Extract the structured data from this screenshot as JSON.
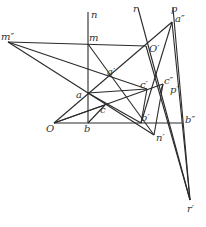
{
  "diagram": {
    "type": "geometric-construction",
    "line_color": "#2a2a2a",
    "label_color": "#333333",
    "points": {
      "m2": {
        "label": "m″",
        "x": 8,
        "y": 42,
        "lx": 1,
        "ly": 40
      },
      "m": {
        "label": "m",
        "x": 88,
        "y": 44,
        "lx": 89,
        "ly": 41
      },
      "n": {
        "label": "n",
        "x": 88,
        "y": 12,
        "lx": 91,
        "ly": 18
      },
      "r": {
        "label": "r",
        "x": 138,
        "y": 8,
        "lx": 133,
        "ly": 12
      },
      "p": {
        "label": "p",
        "x": 173,
        "y": 8,
        "lx": 171,
        "ly": 12
      },
      "a2": {
        "label": "a″",
        "x": 172,
        "y": 22,
        "lx": 175,
        "ly": 22
      },
      "O1": {
        "label": "O′",
        "x": 146,
        "y": 46,
        "lx": 149,
        "ly": 52
      },
      "a1": {
        "label": "a′",
        "x": 109,
        "y": 77,
        "lx": 107,
        "ly": 75
      },
      "a": {
        "label": "a",
        "x": 88,
        "y": 93,
        "lx": 76,
        "ly": 98
      },
      "c": {
        "label": "c",
        "x": 105,
        "y": 105,
        "lx": 100,
        "ly": 113
      },
      "c1": {
        "label": "c′",
        "x": 147,
        "y": 89,
        "lx": 140,
        "ly": 88
      },
      "c2": {
        "label": "c″",
        "x": 163,
        "y": 84,
        "lx": 164,
        "ly": 84
      },
      "p1": {
        "label": "p′",
        "x": 160,
        "y": 93,
        "lx": 170,
        "ly": 93
      },
      "O": {
        "label": "O",
        "x": 54,
        "y": 123,
        "lx": 46,
        "ly": 132
      },
      "b": {
        "label": "b",
        "x": 88,
        "y": 123,
        "lx": 84,
        "ly": 132
      },
      "b1": {
        "label": "b′",
        "x": 141,
        "y": 123,
        "lx": 141,
        "ly": 121
      },
      "b2": {
        "label": "b″",
        "x": 182,
        "y": 123,
        "lx": 185,
        "ly": 123
      },
      "n1": {
        "label": "n′",
        "x": 154,
        "y": 135,
        "lx": 156,
        "ly": 141
      },
      "r1": {
        "label": "r′",
        "x": 190,
        "y": 200,
        "lx": 187,
        "ly": 212
      }
    },
    "segments": [
      [
        "m2",
        "O1"
      ],
      [
        "m2",
        "c1"
      ],
      [
        "m2",
        "n1"
      ],
      [
        "n",
        "b"
      ],
      [
        "O",
        "b2"
      ],
      [
        "O",
        "a2"
      ],
      [
        "O",
        "c2"
      ],
      [
        "a",
        "c1"
      ],
      [
        "a",
        "b1"
      ],
      [
        "m",
        "n1"
      ],
      [
        "b",
        "c"
      ],
      [
        "r",
        "r1"
      ],
      [
        "p",
        "r1"
      ],
      [
        "a2",
        "b1"
      ],
      [
        "a2",
        "r1"
      ],
      [
        "O1",
        "r1"
      ],
      [
        "c2",
        "n1"
      ],
      [
        "c1",
        "b1"
      ],
      [
        "c2",
        "p1"
      ],
      [
        "O",
        "c"
      ]
    ]
  }
}
